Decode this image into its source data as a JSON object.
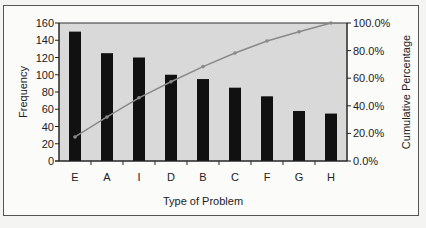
{
  "chart_data": {
    "type": "pareto",
    "title": "",
    "xlabel": "Type of Problem",
    "ylabel": "Frequency",
    "y2label": "Cumulative Percentage",
    "categories": [
      "E",
      "A",
      "I",
      "D",
      "B",
      "C",
      "F",
      "G",
      "H"
    ],
    "series": [
      {
        "name": "Frequency",
        "type": "bar",
        "axis": "left",
        "values": [
          150,
          125,
          120,
          100,
          95,
          85,
          75,
          58,
          55
        ]
      },
      {
        "name": "Cumulative Percentage",
        "type": "line",
        "axis": "right",
        "values": [
          17.4,
          31.9,
          45.8,
          57.4,
          68.4,
          78.3,
          87.0,
          93.6,
          100.0
        ]
      }
    ],
    "ylim": [
      0,
      160
    ],
    "yticks": [
      0,
      20,
      40,
      60,
      80,
      100,
      120,
      140,
      160
    ],
    "y2lim": [
      0,
      100
    ],
    "y2ticks": [
      "0.0%",
      "20.0%",
      "40.0%",
      "60.0%",
      "80.0%",
      "100.0%"
    ],
    "grid": false,
    "legend": "none",
    "colors": {
      "bar": "#111111",
      "line": "#8a8a8a",
      "plot_bg": "#d9d9d9"
    }
  }
}
